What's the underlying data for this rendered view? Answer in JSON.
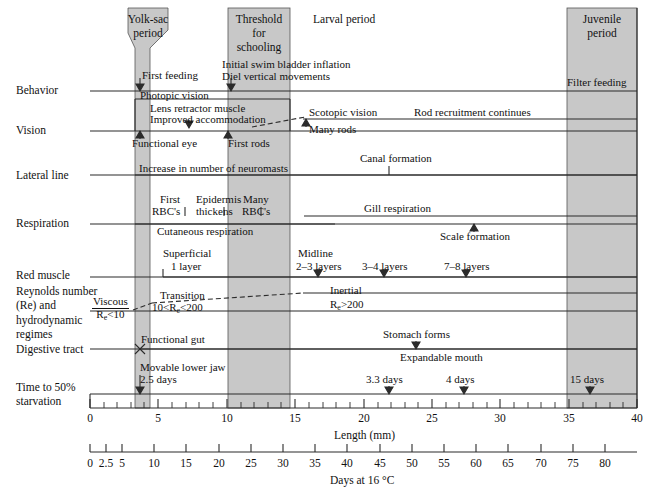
{
  "figure": {
    "type": "developmental-timeline-diagram",
    "band_fill": "#c8c8c8",
    "line_color": "#2b2b2b"
  },
  "bands": [
    {
      "id": "yolk-sac",
      "label_line1": "Yolk-sac",
      "label_line2": "period",
      "shape": "funnel",
      "x_start_mm": 2.9,
      "x_end_mm": 4.1,
      "funnel_top_start_mm": 2.0,
      "funnel_top_end_mm": 5.2
    },
    {
      "id": "schooling",
      "label_line1": "Threshold",
      "label_line2": "for",
      "label_line3": "schooling",
      "shape": "rect",
      "x_start_mm": 10.0,
      "x_end_mm": 14.5
    },
    {
      "id": "juvenile",
      "label_line1": "Juvenile",
      "label_line2": "period",
      "shape": "rect",
      "x_start_mm": 35.0,
      "x_end_mm": 40.0
    }
  ],
  "period_labels": [
    {
      "id": "larval",
      "text": "Larval period",
      "x_mm": 16.5
    }
  ],
  "rows": [
    {
      "id": "behavior",
      "label": "Behavior"
    },
    {
      "id": "vision",
      "label": "Vision"
    },
    {
      "id": "lateral-line",
      "label": "Lateral line"
    },
    {
      "id": "respiration",
      "label": "Respiration"
    },
    {
      "id": "red-muscle",
      "label": "Red muscle"
    },
    {
      "id": "reynolds",
      "label": "Reynolds number\n(Re) and\nhydrodynamic\nregimes"
    },
    {
      "id": "digestive",
      "label": "Digestive tract"
    },
    {
      "id": "starvation",
      "label": "Time to 50%\nstarvation"
    }
  ],
  "events": {
    "behavior": [
      {
        "text": "First feeding",
        "marker": "arrow-down",
        "at_mm": 4.0
      },
      {
        "text": "Initial swim bladder inflation",
        "marker": "none"
      },
      {
        "text": "Diel vertical movements",
        "marker": "arrow-down",
        "at_mm": 10.2
      },
      {
        "text": "Filter feeding",
        "marker": "none"
      }
    ],
    "vision": [
      {
        "text": "Photopic vision",
        "marker": "none"
      },
      {
        "text": "Lens retractor muscle",
        "marker": "none"
      },
      {
        "text": "Improved accommodation",
        "marker": "arrow-down",
        "at_mm": 7.4
      },
      {
        "text": "Functional eye",
        "marker": "arrow-up",
        "at_mm": 3.6
      },
      {
        "text": "First rods",
        "marker": "arrow-up",
        "at_mm": 10.0
      },
      {
        "text": "Scotopic vision",
        "marker": "none"
      },
      {
        "text": "Many rods",
        "marker": "arrow-up",
        "at_mm": 19.8
      },
      {
        "text": "Rod recruitment continues",
        "marker": "none"
      }
    ],
    "lateral-line": [
      {
        "text": "Increase in number of neuromasts",
        "marker": "none"
      },
      {
        "text": "Canal formation",
        "marker": "tick-down",
        "at_mm": 22.3
      }
    ],
    "respiration": [
      {
        "text": "First",
        "marker": "tick-down",
        "at_mm": 6.0
      },
      {
        "text": "RBC's",
        "marker": "none"
      },
      {
        "text": "Epidermis",
        "marker": "none"
      },
      {
        "text": "thickens",
        "marker": "tick-down",
        "at_mm": 9.3
      },
      {
        "text": "Many",
        "marker": "none"
      },
      {
        "text": "RBC's",
        "marker": "tick-down",
        "at_mm": 12.3
      },
      {
        "text": "Cutaneous respiration",
        "marker": "none"
      },
      {
        "text": "Gill respiration",
        "marker": "none"
      },
      {
        "text": "Scale formation",
        "marker": "arrow-up",
        "at_mm": 27.5
      }
    ],
    "red-muscle": [
      {
        "text": "Superficial",
        "marker": "none"
      },
      {
        "text": "1 layer",
        "marker": "none"
      },
      {
        "text": "Midline",
        "marker": "none"
      },
      {
        "text": "2–3 layers",
        "marker": "arrow-down",
        "at_mm": 17.0
      },
      {
        "text": "3–4 layers",
        "marker": "arrow-down",
        "at_mm": 22.0
      },
      {
        "text": "7–8 layers",
        "marker": "arrow-down",
        "at_mm": 28.2
      }
    ],
    "reynolds": [
      {
        "text": "Viscous",
        "fraction_num": "Viscous",
        "fraction_den": "Re<10",
        "marker": "none"
      },
      {
        "text": "Transition",
        "marker": "none"
      },
      {
        "text": "10<Re<200",
        "marker": "none"
      },
      {
        "text": "Inertial",
        "marker": "none"
      },
      {
        "text": "Re>200",
        "marker": "none"
      }
    ],
    "digestive": [
      {
        "text": "Functional gut",
        "marker": "x-mark",
        "at_mm": 4.0
      },
      {
        "text": "Stomach forms",
        "marker": "arrow-down",
        "at_mm": 23.8
      },
      {
        "text": "Expandable mouth",
        "marker": "none"
      }
    ],
    "starvation": [
      {
        "text": "Movable lower jaw",
        "marker": "none"
      },
      {
        "text": "2.5 days",
        "marker": "arrow-down",
        "at_mm": 4.0
      },
      {
        "text": "3.3 days",
        "marker": "arrow-down",
        "at_mm": 21.9
      },
      {
        "text": "4 days",
        "marker": "arrow-down",
        "at_mm": 27.4
      },
      {
        "text": "15 days",
        "marker": "arrow-down",
        "at_mm": 36.6
      }
    ]
  },
  "axes": {
    "length": {
      "title": "Length (mm)",
      "min": 0,
      "max": 40,
      "major_ticks": [
        0,
        5,
        10,
        15,
        20,
        25,
        30,
        35,
        40
      ],
      "labels": [
        "0",
        "5",
        "10",
        "15",
        "20",
        "25",
        "30",
        "35",
        "40"
      ],
      "minor_step": 1
    },
    "days": {
      "title": "Days at 16 °C",
      "min": 0,
      "max": 85,
      "labeled_ticks": [
        0,
        2.5,
        5,
        10,
        15,
        20,
        25,
        30,
        35,
        40,
        45,
        50,
        55,
        60,
        65,
        70,
        75,
        80
      ],
      "labels": [
        "0",
        "2.5",
        "5",
        "10",
        "15",
        "20",
        "25",
        "30",
        "35",
        "40",
        "45",
        "50",
        "55",
        "60",
        "65",
        "70",
        "75",
        "80"
      ],
      "minor_step": 5
    }
  }
}
